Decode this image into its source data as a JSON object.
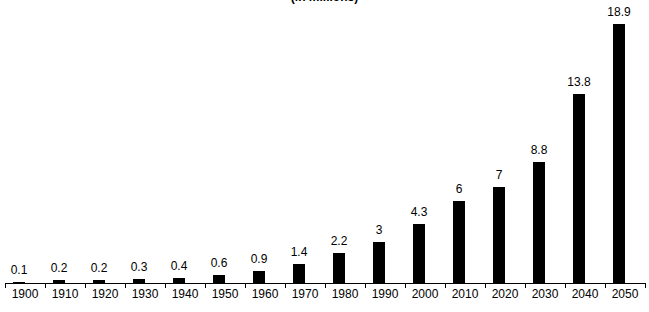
{
  "chart_data": {
    "type": "bar",
    "title": "(in millions)",
    "categories": [
      "1900",
      "1910",
      "1920",
      "1930",
      "1940",
      "1950",
      "1960",
      "1970",
      "1980",
      "1990",
      "2000",
      "2010",
      "2020",
      "2030",
      "2040",
      "2050"
    ],
    "values": [
      0.1,
      0.2,
      0.2,
      0.3,
      0.4,
      0.6,
      0.9,
      1.4,
      2.2,
      3,
      4.3,
      6,
      7,
      8.8,
      13.8,
      18.9
    ],
    "value_labels": [
      "0.1",
      "0.2",
      "0.2",
      "0.3",
      "0.4",
      "0.6",
      "0.9",
      "1.4",
      "2.2",
      "3",
      "4.3",
      "6",
      "7",
      "8.8",
      "13.8",
      "18.9"
    ],
    "xlabel": "",
    "ylabel": "",
    "ylim": [
      0,
      19
    ],
    "grid": false,
    "legend": false,
    "colors": {
      "bar": "#000000",
      "axis": "#000000",
      "text": "#000000",
      "background": "#ffffff"
    }
  }
}
